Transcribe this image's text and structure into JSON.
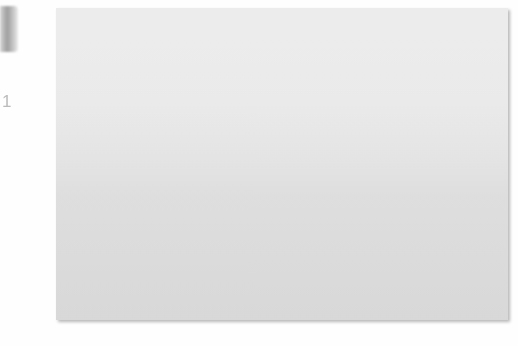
{
  "unit_label": "°C",
  "x_axis_name": "year",
  "colors": {
    "line_dark": "#121212",
    "line_light": "#b9b9b9",
    "fill_upper": "#4a4a4a",
    "fill_mid": "#9a9a9a",
    "grid": "#ffffff",
    "panel_light": "#ededed",
    "panel_dark": "#d8d8d8"
  },
  "legend": {
    "items": [
      {
        "text": "Rise in temperatures if current\ncarbon dioxide emissions continue",
        "marker": "zigzag-icon",
        "marker_color": "#121212"
      },
      {
        "text": "Rise in temperatures if some cuts\nare made to carbon dioxide emissions",
        "marker": "zigzag-icon",
        "marker_color": "#121212"
      },
      {
        "text": "Rise in temperatures if carbon dioxide\nemissions are drastically cut",
        "marker": "zigzag-icon",
        "marker_color": "#b9b9b9"
      }
    ]
  },
  "chart_data": {
    "type": "line",
    "xlabel": "year",
    "ylabel": "°C",
    "xlim": [
      1945,
      2065
    ],
    "ylim": [
      -0.5,
      3.6
    ],
    "yticks": [
      -0.5,
      0,
      1.0,
      2.0,
      3.0
    ],
    "ytick_labels": [
      "-0.5",
      "0",
      "+1.0",
      "+2.0",
      "+3.0"
    ],
    "xticks": [
      1950,
      1970,
      1990,
      2010,
      2030,
      2050
    ],
    "xtick_labels": [
      "1950",
      "1970",
      "1990",
      "2010",
      "2030",
      "2050"
    ],
    "grid": true,
    "legend_position": "inside-lower-right",
    "series": [
      {
        "name": "Historical / observed",
        "color": "#121212",
        "x": [
          1948,
          1950,
          1952,
          1954,
          1956,
          1958,
          1960,
          1962,
          1964,
          1966,
          1968,
          1970,
          1972,
          1974,
          1976,
          1978,
          1980,
          1982,
          1984,
          1986,
          1988,
          1990,
          1992,
          1994,
          1996,
          1998,
          2000,
          2002,
          2004,
          2006,
          2008,
          2010
        ],
        "y": [
          0.62,
          0.55,
          0.78,
          0.4,
          0.72,
          0.58,
          0.82,
          0.6,
          0.74,
          0.52,
          0.66,
          0.46,
          0.7,
          0.52,
          0.64,
          0.5,
          0.68,
          0.55,
          1.05,
          0.78,
          1.12,
          0.82,
          1.18,
          0.9,
          1.26,
          0.95,
          1.35,
          1.1,
          1.48,
          1.2,
          1.62,
          1.3
        ]
      },
      {
        "name": "Rise in temperatures if current carbon dioxide emissions continue",
        "color": "#121212",
        "x": [
          2010,
          2012,
          2014,
          2016,
          2018,
          2020,
          2022,
          2024,
          2026,
          2028,
          2030,
          2032,
          2034,
          2036,
          2038,
          2040,
          2042,
          2044,
          2046,
          2048,
          2050,
          2052,
          2054,
          2056,
          2058,
          2060
        ],
        "y": [
          1.3,
          1.85,
          1.55,
          2.1,
          1.78,
          2.28,
          1.95,
          2.45,
          2.12,
          2.62,
          2.25,
          2.8,
          2.42,
          2.95,
          2.58,
          3.1,
          2.72,
          3.22,
          2.86,
          3.35,
          2.98,
          3.42,
          3.08,
          3.5,
          3.18,
          3.58
        ]
      },
      {
        "name": "Rise in temperatures if some cuts are made to carbon dioxide emissions",
        "color": "#121212",
        "x": [
          2010,
          2012,
          2014,
          2016,
          2018,
          2020,
          2022,
          2024,
          2026,
          2028,
          2030,
          2032,
          2034,
          2036,
          2038,
          2040,
          2042,
          2044,
          2046,
          2048,
          2050,
          2052,
          2054,
          2056,
          2058,
          2060
        ],
        "y": [
          1.3,
          1.02,
          1.42,
          1.1,
          1.58,
          1.22,
          1.7,
          1.34,
          1.86,
          1.48,
          1.95,
          1.62,
          2.06,
          1.74,
          2.18,
          1.85,
          2.28,
          1.96,
          2.4,
          2.08,
          2.52,
          2.18,
          2.62,
          2.3,
          2.74,
          2.86
        ]
      },
      {
        "name": "Rise in temperatures if carbon dioxide emissions are drastically cut",
        "color": "#b9b9b9",
        "x": [
          2010,
          2012,
          2014,
          2016,
          2018,
          2020,
          2022,
          2024,
          2026,
          2028,
          2030,
          2032,
          2034,
          2036,
          2038,
          2040,
          2042,
          2044,
          2046,
          2048,
          2050,
          2052,
          2054,
          2056,
          2058,
          2060
        ],
        "y": [
          1.3,
          0.88,
          1.18,
          0.8,
          1.3,
          0.92,
          1.4,
          1.0,
          1.52,
          1.08,
          1.62,
          1.16,
          1.7,
          1.26,
          1.8,
          1.34,
          1.88,
          1.42,
          1.96,
          1.52,
          2.04,
          1.6,
          2.12,
          1.7,
          2.2,
          2.05
        ]
      }
    ]
  }
}
